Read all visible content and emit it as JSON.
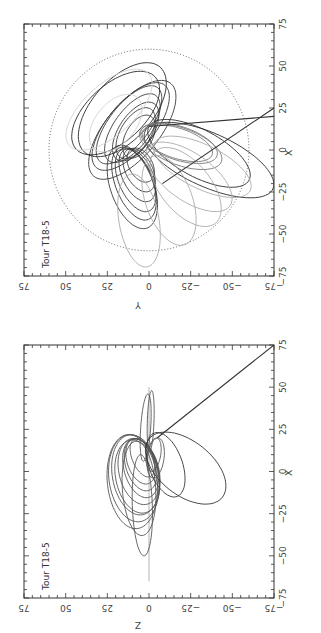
{
  "figure": {
    "orientation": "rotated 90 degrees counterclockwise",
    "panels": [
      "top",
      "bottom"
    ]
  },
  "chart_data": [
    {
      "type": "line",
      "title": "Tour T18-5",
      "xlabel": "X",
      "ylabel": "Y",
      "projection": "X-Y plane",
      "xlim": [
        -75,
        75
      ],
      "ylim": [
        -75,
        75
      ],
      "x_ticks": [
        "-75",
        "-50",
        "-25",
        "0",
        "25",
        "50",
        "75"
      ],
      "y_ticks": [
        "-75",
        "-50",
        "-25",
        "0",
        "25",
        "50",
        "75"
      ],
      "grid": false,
      "reference_circle": {
        "center": [
          0,
          0
        ],
        "radius": 60,
        "style": "dotted"
      },
      "orbit_families": [
        {
          "name": "dark-inner-lobe",
          "color": "#3a3a3a",
          "ellipses": [
            {
              "cx": 12,
              "cy": 10,
              "a": 36,
              "b": 16,
              "rot": -40
            },
            {
              "cx": 14,
              "cy": 11,
              "a": 32,
              "b": 14,
              "rot": -40
            },
            {
              "cx": 15,
              "cy": 12,
              "a": 28,
              "b": 12,
              "rot": -38
            },
            {
              "cx": 13,
              "cy": 10,
              "a": 24,
              "b": 11,
              "rot": -36
            },
            {
              "cx": 11,
              "cy": 8,
              "a": 20,
              "b": 10,
              "rot": -34
            },
            {
              "cx": 10,
              "cy": 8,
              "a": 17,
              "b": 9,
              "rot": -32
            },
            {
              "cx": 8,
              "cy": 6,
              "a": 14,
              "b": 8,
              "rot": -30
            }
          ]
        },
        {
          "name": "dark-lower-lobe",
          "color": "#3a3a3a",
          "ellipses": [
            {
              "cx": -22,
              "cy": 10,
              "a": 26,
              "b": 13,
              "rot": 20
            },
            {
              "cx": -20,
              "cy": 9,
              "a": 23,
              "b": 11,
              "rot": 22
            },
            {
              "cx": -18,
              "cy": 8,
              "a": 20,
              "b": 10,
              "rot": 24
            },
            {
              "cx": -15,
              "cy": 7,
              "a": 17,
              "b": 9,
              "rot": 26
            },
            {
              "cx": -12,
              "cy": 6,
              "a": 14,
              "b": 8,
              "rot": 28
            },
            {
              "cx": -9,
              "cy": 5,
              "a": 11,
              "b": 7,
              "rot": 30
            }
          ]
        },
        {
          "name": "dark-outer-loops",
          "color": "#2a2a2a",
          "ellipses": [
            {
              "cx": 24,
              "cy": 16,
              "a": 34,
              "b": 18,
              "rot": -42
            },
            {
              "cx": 22,
              "cy": 20,
              "a": 32,
              "b": 17,
              "rot": -48
            },
            {
              "cx": -2,
              "cy": -30,
              "a": 34,
              "b": 14,
              "rot": 62
            },
            {
              "cx": -6,
              "cy": -36,
              "a": 42,
              "b": 16,
              "rot": 66
            }
          ]
        },
        {
          "name": "mid-gray-right",
          "color": "#777777",
          "ellipses": [
            {
              "cx": 4,
              "cy": -18,
              "a": 24,
              "b": 10,
              "rot": 72
            },
            {
              "cx": 4,
              "cy": -17,
              "a": 22,
              "b": 9,
              "rot": 72
            },
            {
              "cx": 2,
              "cy": -19,
              "a": 26,
              "b": 11,
              "rot": 70
            }
          ]
        },
        {
          "name": "light-gray-loops",
          "color": "#aaaaaa",
          "ellipses": [
            {
              "cx": -16,
              "cy": -24,
              "a": 30,
              "b": 14,
              "rot": 55
            },
            {
              "cx": -22,
              "cy": -22,
              "a": 28,
              "b": 15,
              "rot": 40
            },
            {
              "cx": -30,
              "cy": -12,
              "a": 28,
              "b": 14,
              "rot": 20
            },
            {
              "cx": -42,
              "cy": 6,
              "a": 28,
              "b": 12,
              "rot": 10
            },
            {
              "cx": -10,
              "cy": -32,
              "a": 32,
              "b": 13,
              "rot": 64
            }
          ]
        },
        {
          "name": "very-light-upper",
          "color": "#d2d2d2",
          "ellipses": [
            {
              "cx": 24,
              "cy": 24,
              "a": 32,
              "b": 15,
              "rot": -48
            },
            {
              "cx": 16,
              "cy": 20,
              "a": 20,
              "b": 12,
              "rot": -40
            }
          ]
        }
      ],
      "trajectory_lines": [
        {
          "from": [
            -20,
            -8
          ],
          "to": [
            25,
            -75
          ],
          "color": "#333333"
        },
        {
          "from": [
            14,
            0
          ],
          "to": [
            20,
            -75
          ],
          "color": "#333333"
        }
      ]
    },
    {
      "type": "line",
      "title": "Tour T18-5",
      "xlabel": "X",
      "ylabel": "Z",
      "projection": "X-Z plane",
      "xlim": [
        -75,
        75
      ],
      "ylim": [
        -75,
        75
      ],
      "x_ticks": [
        "-75",
        "-50",
        "-25",
        "0",
        "25",
        "50",
        "75"
      ],
      "y_ticks": [
        "-75",
        "-50",
        "-25",
        "0",
        "25",
        "50",
        "75"
      ],
      "grid": false,
      "equator_line": {
        "z": 0,
        "x_from": -65,
        "x_to": 50,
        "color": "#aaaaaa"
      },
      "orbit_families": [
        {
          "name": "inclined-loops",
          "color": "#555555",
          "ellipses": [
            {
              "cx": -2,
              "cy": 8,
              "a": 24,
              "b": 14,
              "rot": 10
            },
            {
              "cx": -4,
              "cy": 9,
              "a": 26,
              "b": 15,
              "rot": 8
            },
            {
              "cx": -6,
              "cy": 10,
              "a": 28,
              "b": 15,
              "rot": 6
            },
            {
              "cx": -3,
              "cy": 7,
              "a": 22,
              "b": 13,
              "rot": 12
            },
            {
              "cx": 0,
              "cy": 6,
              "a": 20,
              "b": 12,
              "rot": 14
            },
            {
              "cx": 2,
              "cy": 5,
              "a": 18,
              "b": 10,
              "rot": 16
            },
            {
              "cx": 4,
              "cy": 5,
              "a": 16,
              "b": 9,
              "rot": 18
            },
            {
              "cx": 6,
              "cy": 5,
              "a": 14,
              "b": 8,
              "rot": 20
            },
            {
              "cx": 8,
              "cy": 4,
              "a": 12,
              "b": 6,
              "rot": 24
            },
            {
              "cx": -10,
              "cy": 6,
              "a": 28,
              "b": 10,
              "rot": 4
            },
            {
              "cx": -20,
              "cy": 4,
              "a": 30,
              "b": 6,
              "rot": 2
            },
            {
              "cx": 26,
              "cy": 2,
              "a": 20,
              "b": 3,
              "rot": -4
            },
            {
              "cx": 30,
              "cy": -1,
              "a": 18,
              "b": 2,
              "rot": -2
            },
            {
              "cx": 10,
              "cy": -3,
              "a": 10,
              "b": 4,
              "rot": -10
            },
            {
              "cx": 8,
              "cy": -4,
              "a": 12,
              "b": 5,
              "rot": -8
            }
          ]
        },
        {
          "name": "large-loop",
          "color": "#333333",
          "ellipses": [
            {
              "cx": 2,
              "cy": -22,
              "a": 28,
              "b": 16,
              "rot": 52
            },
            {
              "cx": 4,
              "cy": -10,
              "a": 20,
              "b": 10,
              "rot": 20
            }
          ]
        }
      ],
      "trajectory_lines": [
        {
          "from": [
            20,
            -5
          ],
          "to": [
            75,
            -75
          ],
          "color": "#333333"
        }
      ]
    }
  ],
  "panels": {
    "top": {
      "title": "Tour T18-5",
      "x_axis_label": "X",
      "y_axis_label": "Y"
    },
    "bottom": {
      "title": "Tour T18-5",
      "x_axis_label": "X",
      "y_axis_label": "Z"
    }
  }
}
